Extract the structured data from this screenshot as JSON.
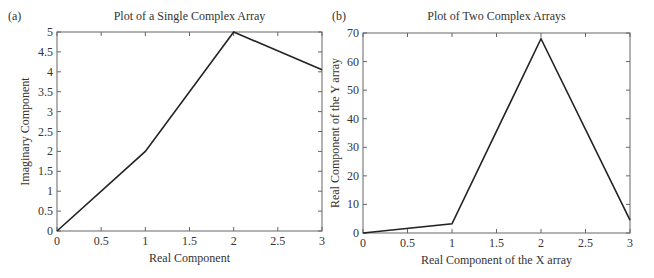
{
  "chart_data": [
    {
      "type": "line",
      "panel_label": "(a)",
      "title": "Plot of a Single Complex Array",
      "xlabel": "Real Component",
      "ylabel": "Imaginary Component",
      "xlim": [
        0,
        3
      ],
      "ylim": [
        0,
        5
      ],
      "xticks": [
        "0",
        "0.5",
        "1",
        "1.5",
        "2",
        "2.5",
        "3"
      ],
      "yticks": [
        "0",
        "0.5",
        "1",
        "1.5",
        "2",
        "2.5",
        "3",
        "3.5",
        "4",
        "4.5",
        "5"
      ],
      "grid": false,
      "x": [
        0,
        1,
        2,
        3
      ],
      "y": [
        0,
        2,
        5,
        4.05
      ]
    },
    {
      "type": "line",
      "panel_label": "(b)",
      "title": "Plot of Two Complex Arrays",
      "xlabel": "Real Component of the X array",
      "ylabel": "Real Component of the Y array",
      "xlim": [
        0,
        3
      ],
      "ylim": [
        0,
        70
      ],
      "xticks": [
        "0",
        "0.5",
        "1",
        "1.5",
        "2",
        "2.5",
        "3"
      ],
      "yticks": [
        "0",
        "10",
        "20",
        "30",
        "40",
        "50",
        "60",
        "70"
      ],
      "grid": false,
      "x": [
        0,
        1,
        2,
        3
      ],
      "y": [
        0,
        3.2,
        68,
        4.5
      ]
    }
  ]
}
